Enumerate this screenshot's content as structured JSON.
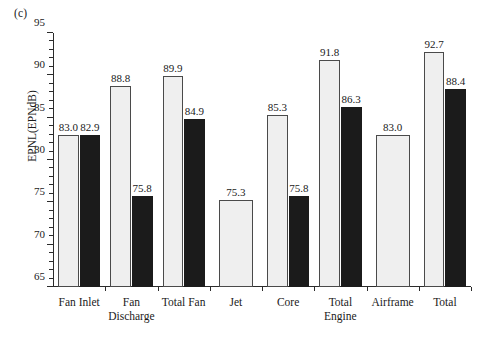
{
  "panel": {
    "label": "(c)"
  },
  "chart_data": {
    "type": "bar",
    "title": "",
    "subtitle": "",
    "xlabel": "",
    "ylabel": "EPNL(EPNdB)",
    "ylim": [
      65,
      95
    ],
    "ytick_major_step": 5,
    "ytick_minor_step": 1,
    "ytick_labels": [
      "65",
      "70",
      "75",
      "80",
      "85",
      "90",
      "95"
    ],
    "ytick_values": [
      65,
      70,
      75,
      80,
      85,
      90,
      95
    ],
    "grid": false,
    "legend": "none",
    "categories": [
      {
        "line1": "Fan Inlet",
        "line2": ""
      },
      {
        "line1": "Fan",
        "line2": "Discharge"
      },
      {
        "line1": "Total Fan",
        "line2": ""
      },
      {
        "line1": "Jet",
        "line2": ""
      },
      {
        "line1": "Core",
        "line2": ""
      },
      {
        "line1": "Total",
        "line2": "Engine"
      },
      {
        "line1": "Airframe",
        "line2": ""
      },
      {
        "line1": "Total",
        "line2": ""
      }
    ],
    "series": [
      {
        "name": "light",
        "style": "open",
        "values": [
          83.0,
          88.8,
          89.9,
          75.3,
          85.3,
          91.8,
          83.0,
          92.7
        ],
        "labels": [
          "83.0",
          "88.8",
          "89.9",
          "75.3",
          "85.3",
          "91.8",
          "83.0",
          "92.7"
        ]
      },
      {
        "name": "dark",
        "style": "filled",
        "values": [
          82.9,
          75.8,
          84.9,
          null,
          75.8,
          86.3,
          null,
          88.4
        ],
        "labels": [
          "82.9",
          "75.8",
          "84.9",
          "",
          "75.8",
          "86.3",
          "",
          "88.4"
        ]
      }
    ],
    "colors": {
      "light_fill": "#efefef",
      "light_edge": "#4a4a4a",
      "dark_fill": "#1b1b1b",
      "axis": "#2b2b2b",
      "text": "#1a1a1a",
      "background": "#ffffff"
    }
  }
}
